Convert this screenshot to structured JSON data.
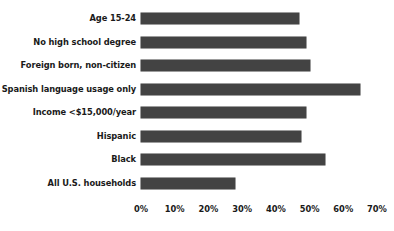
{
  "chart_data": {
    "type": "bar",
    "orientation": "horizontal",
    "title": "",
    "subtitle": "",
    "xlabel": "",
    "ylabel": "",
    "grid": false,
    "legend": false,
    "legend_position": "none",
    "bar_color": "#434343",
    "text_color": "#1a1a1a",
    "background": "#ffffff",
    "xlim": [
      0,
      70
    ],
    "xtick_labels": [
      "0%",
      "10%",
      "20%",
      "30%",
      "40%",
      "50%",
      "60%",
      "70%"
    ],
    "xticks": [
      0,
      10,
      20,
      30,
      40,
      50,
      60,
      70
    ],
    "categories": [
      "Age 15-24",
      "No high school degree",
      "Foreign born, non-citizen",
      "Spanish language usage only",
      "Income <$15,000/year",
      "Hispanic",
      "Black",
      "All U.S. households"
    ],
    "values": [
      47,
      49,
      50,
      65,
      49,
      47.5,
      54.5,
      28
    ],
    "series": [
      {
        "name": "Percent",
        "values": [
          47,
          49,
          50,
          65,
          49,
          47.5,
          54.5,
          28
        ]
      }
    ]
  }
}
